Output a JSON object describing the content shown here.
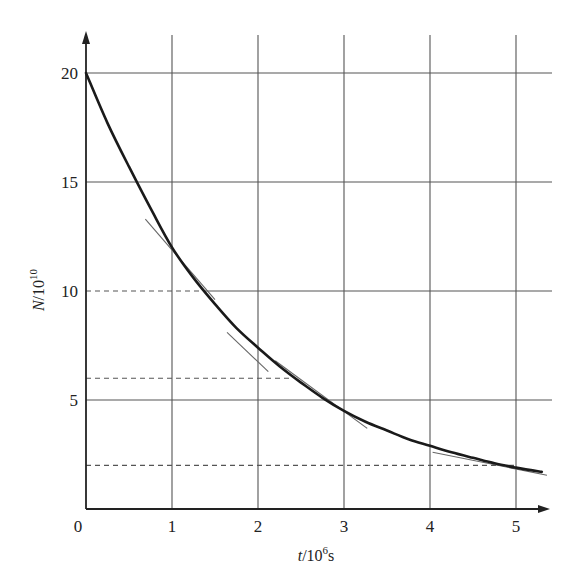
{
  "chart_data": {
    "type": "line",
    "title": "",
    "xlabel": "t/10^6 s",
    "xlabel_parts": {
      "var": "t",
      "base": "/10",
      "exp": "6",
      "unit": "s"
    },
    "ylabel": "N/10^10",
    "ylabel_parts": {
      "var": "N",
      "base": "/10",
      "exp": "10"
    },
    "xlim": [
      0,
      5.4
    ],
    "ylim": [
      0,
      21.5
    ],
    "x_ticks": [
      0,
      1,
      2,
      3,
      4,
      5
    ],
    "x_tick_labels": [
      "0",
      "1",
      "2",
      "3",
      "4",
      "5"
    ],
    "y_ticks": [
      5,
      10,
      15,
      20
    ],
    "y_tick_labels": [
      "5",
      "10",
      "15",
      "20"
    ],
    "origin_label": "0",
    "grid": true,
    "legend": null,
    "series": [
      {
        "name": "decay curve",
        "x": [
          0,
          0.25,
          0.5,
          0.75,
          1.0,
          1.25,
          1.5,
          1.75,
          2.0,
          2.25,
          2.5,
          2.75,
          3.0,
          3.25,
          3.5,
          3.75,
          4.0,
          4.25,
          4.5,
          4.75,
          5.0,
          5.3
        ],
        "values": [
          20.0,
          17.7,
          15.7,
          13.8,
          12.0,
          10.6,
          9.4,
          8.3,
          7.4,
          6.55,
          5.8,
          5.1,
          4.5,
          4.0,
          3.6,
          3.2,
          2.9,
          2.6,
          2.35,
          2.1,
          1.9,
          1.7
        ]
      }
    ],
    "tangent_lines": [
      {
        "name": "tangent-at-N10",
        "x": [
          0.69,
          1.5
        ],
        "y": [
          13.3,
          9.6
        ]
      },
      {
        "name": "tangent-at-N7",
        "x": [
          1.64,
          2.12
        ],
        "y": [
          8.1,
          6.3
        ]
      },
      {
        "name": "tangent-at-N5",
        "x": [
          2.2,
          3.27
        ],
        "y": [
          6.8,
          3.7
        ]
      },
      {
        "name": "tangent-at-N2",
        "x": [
          4.03,
          5.36
        ],
        "y": [
          2.6,
          1.55
        ]
      }
    ],
    "reference_lines": [
      {
        "y": 10,
        "style": "dashed",
        "x_end": 1.4
      },
      {
        "y": 6,
        "style": "dashed",
        "x_end": 2.4
      },
      {
        "y": 2,
        "style": "dashed",
        "x_end": 5.0
      }
    ]
  }
}
